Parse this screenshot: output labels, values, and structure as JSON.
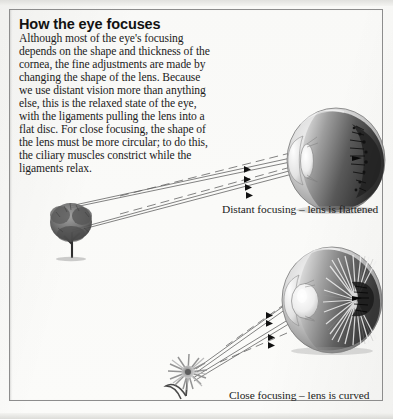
{
  "page": {
    "width": 393,
    "height": 419,
    "background_color": "#fbfbf9",
    "border_color": "#8d8d8d",
    "ink_color": "#1b1b1b"
  },
  "heading": "How the eye focuses",
  "body_lines": [
    "Although most of the eye's focusing",
    "depends on the shape and thickness of the",
    "cornea, the fine adjustments are made by",
    "changing the shape of the lens. Because",
    "we use distant vision more than anything",
    "else, this is the relaxed state of the eye,",
    "with the ligaments pulling the lens into a",
    "flat disc. For close focusing, the shape of",
    "the lens must be more circular; to do this,",
    "the ciliary muscles constrict while the",
    "ligaments relax."
  ],
  "captions": {
    "top": "Distant focusing – lens is flattened",
    "bottom": "Close focusing – lens is curved"
  },
  "illustrations": {
    "tree": {
      "label": "tree-distant-object"
    },
    "flower": {
      "label": "flower-close-object"
    },
    "eye_top": {
      "label": "eyeball-flattened-lens"
    },
    "eye_bottom": {
      "label": "eyeball-curved-lens"
    }
  },
  "ray_colors": {
    "line": "#555555",
    "arrow": "#111111"
  }
}
